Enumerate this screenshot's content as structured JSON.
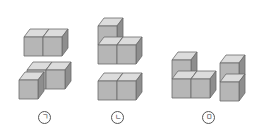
{
  "figure": {
    "colors": {
      "top_face": "#dcdcdc",
      "front_face": "#b6b6b6",
      "side_face": "#8e8e8e",
      "edge": "#6b6b6b"
    },
    "cube": {
      "size": 19,
      "depth_dx": 6,
      "depth_dy": 8
    },
    "groups": [
      {
        "id": "g1",
        "label": "ㄱ",
        "label_pos": [
          38,
          111
        ],
        "pieces": [
          {
            "name": "g1-piece-top",
            "cubes": [
              [
                24,
                37,
                0
              ],
              [
                43,
                37,
                0
              ]
            ],
            "shape": "2 cubes in a row"
          },
          {
            "name": "g1-piece-bottom",
            "cubes": [
              [
                27,
                70,
                0
              ],
              [
                46,
                70,
                0
              ],
              [
                19,
                80,
                0
              ]
            ],
            "shape": "3 cubes L-shape (flat)"
          }
        ]
      },
      {
        "id": "g2",
        "label": "ㄴ",
        "label_pos": [
          111,
          111
        ],
        "pieces": [
          {
            "name": "g2-piece-top",
            "cubes": [
              [
                98,
                26,
                0
              ],
              [
                98,
                45,
                0
              ],
              [
                117,
                45,
                0
              ]
            ],
            "shape": "3 cubes L-shape (upright)"
          },
          {
            "name": "g2-piece-bottom",
            "cubes": [
              [
                98,
                81,
                0
              ],
              [
                117,
                81,
                0
              ]
            ],
            "shape": "2 cubes in a row"
          }
        ]
      },
      {
        "id": "g3",
        "label": "ㅁ",
        "label_pos": [
          202,
          111
        ],
        "pieces": [
          {
            "name": "g3-piece-left",
            "cubes": [
              [
                172,
                60,
                0
              ],
              [
                172,
                79,
                0
              ],
              [
                191,
                79,
                0
              ]
            ],
            "shape": "3 cubes L-shape (upright)"
          },
          {
            "name": "g3-piece-right",
            "cubes": [
              [
                220,
                63,
                0
              ],
              [
                220,
                82,
                0
              ]
            ],
            "shape": "2 cubes stacked"
          }
        ]
      }
    ]
  }
}
